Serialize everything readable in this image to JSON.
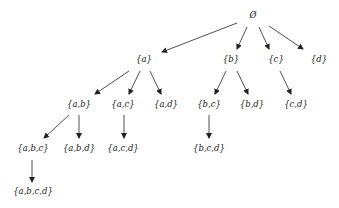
{
  "diagram": {
    "colors": {
      "line": "#222222",
      "text": "#222222",
      "background": "#ffffff"
    },
    "nodes": [
      {
        "id": "empty",
        "label": "Ø",
        "x": 253,
        "y": 15
      },
      {
        "id": "a",
        "label": "{a}",
        "x": 144,
        "y": 59
      },
      {
        "id": "b",
        "label": "{b}",
        "x": 231,
        "y": 59
      },
      {
        "id": "c",
        "label": "{c}",
        "x": 276,
        "y": 59
      },
      {
        "id": "d",
        "label": "{d}",
        "x": 319,
        "y": 59
      },
      {
        "id": "ab",
        "label": "{a,b}",
        "x": 79,
        "y": 104
      },
      {
        "id": "ac",
        "label": "{a,c}",
        "x": 123,
        "y": 104
      },
      {
        "id": "ad",
        "label": "{a,d}",
        "x": 166,
        "y": 104
      },
      {
        "id": "bc",
        "label": "{b,c}",
        "x": 209,
        "y": 104
      },
      {
        "id": "bd",
        "label": "{b,d}",
        "x": 252,
        "y": 104
      },
      {
        "id": "cd",
        "label": "{c,d}",
        "x": 296,
        "y": 104
      },
      {
        "id": "abc",
        "label": "{a,b,c}",
        "x": 33,
        "y": 148
      },
      {
        "id": "abd",
        "label": "{a,b,d}",
        "x": 79,
        "y": 148
      },
      {
        "id": "acd",
        "label": "{a,c,d}",
        "x": 123,
        "y": 148
      },
      {
        "id": "bcd",
        "label": "{b,c,d}",
        "x": 209,
        "y": 148
      },
      {
        "id": "abcd",
        "label": "{a,b,c,d}",
        "x": 33,
        "y": 191
      }
    ],
    "edges": [
      {
        "from": "empty",
        "to": "a",
        "x1": 237,
        "y1": 23,
        "x2": 162,
        "y2": 52
      },
      {
        "from": "empty",
        "to": "b",
        "x1": 247,
        "y1": 27,
        "x2": 237,
        "y2": 49
      },
      {
        "from": "empty",
        "to": "c",
        "x1": 259,
        "y1": 27,
        "x2": 269,
        "y2": 49
      },
      {
        "from": "empty",
        "to": "d",
        "x1": 269,
        "y1": 26,
        "x2": 303,
        "y2": 49
      },
      {
        "from": "a",
        "to": "ab",
        "x1": 129,
        "y1": 71,
        "x2": 95,
        "y2": 94
      },
      {
        "from": "a",
        "to": "ac",
        "x1": 140,
        "y1": 71,
        "x2": 129,
        "y2": 94
      },
      {
        "from": "a",
        "to": "ad",
        "x1": 150,
        "y1": 71,
        "x2": 161,
        "y2": 94
      },
      {
        "from": "b",
        "to": "bc",
        "x1": 226,
        "y1": 71,
        "x2": 215,
        "y2": 94
      },
      {
        "from": "b",
        "to": "bd",
        "x1": 237,
        "y1": 71,
        "x2": 248,
        "y2": 94
      },
      {
        "from": "c",
        "to": "cd",
        "x1": 280,
        "y1": 71,
        "x2": 291,
        "y2": 94
      },
      {
        "from": "ab",
        "to": "abc",
        "x1": 69,
        "y1": 115,
        "x2": 44,
        "y2": 138
      },
      {
        "from": "ab",
        "to": "abd",
        "x1": 79,
        "y1": 115,
        "x2": 79,
        "y2": 138
      },
      {
        "from": "ac",
        "to": "acd",
        "x1": 124,
        "y1": 115,
        "x2": 124,
        "y2": 138
      },
      {
        "from": "bc",
        "to": "bcd",
        "x1": 209,
        "y1": 115,
        "x2": 209,
        "y2": 138
      },
      {
        "from": "abc",
        "to": "abcd",
        "x1": 32,
        "y1": 160,
        "x2": 32,
        "y2": 182
      }
    ]
  }
}
